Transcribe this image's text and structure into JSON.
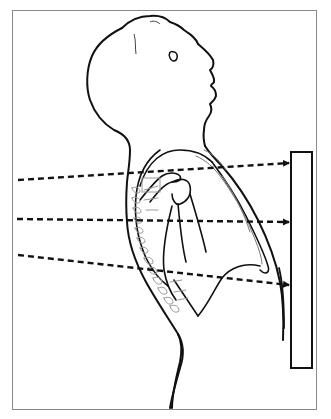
{
  "figure": {
    "elements": {
      "patient": "human-figure-profile",
      "beams": [
        {
          "label": "upper-beam",
          "direction": "rightward-ascending"
        },
        {
          "label": "middle-beam",
          "direction": "rightward-horizontal"
        },
        {
          "label": "lower-beam",
          "direction": "rightward-descending"
        }
      ],
      "detector": "film-plate"
    },
    "colors": {
      "line": "#111111",
      "skeleton": "#9a9a9a",
      "frame": "#8a8a8a",
      "background": "#ffffff"
    },
    "caption": ""
  }
}
